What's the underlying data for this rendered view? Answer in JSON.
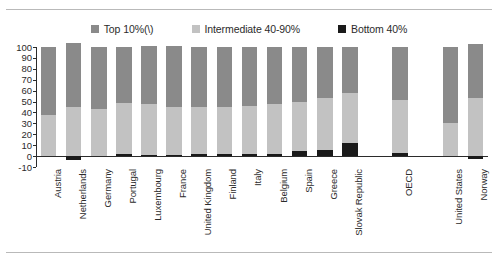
{
  "chart_data": {
    "type": "bar",
    "subtype": "stacked-bar",
    "title": "",
    "xlabel": "",
    "ylabel": "",
    "ylim": [
      -10,
      100
    ],
    "yticks": [
      100,
      90,
      80,
      70,
      60,
      50,
      40,
      30,
      20,
      10,
      0,
      -10
    ],
    "grid": false,
    "legend_position": "top-center",
    "categories": [
      "Austria",
      "Netherlands",
      "Germany",
      "Portugal",
      "Luxembourg",
      "France",
      "United Kingdom",
      "Finland",
      "Italy",
      "Belgium",
      "Spain",
      "Greece",
      "Slovak Republic",
      "OECD",
      "United States",
      "Norway"
    ],
    "series": [
      {
        "name": "Top 10%(\\)",
        "color": "#8a8a8a",
        "values": [
          62,
          59,
          57,
          51,
          53,
          56,
          55,
          55,
          54,
          52,
          50,
          47,
          42,
          49,
          70,
          50
        ]
      },
      {
        "name": "Intermediate 40-90%",
        "color": "#c2c2c2",
        "values": [
          38,
          45,
          43,
          47,
          47,
          44,
          43,
          43,
          44,
          46,
          45,
          47,
          46,
          48,
          30,
          53
        ]
      },
      {
        "name": "Bottom 40%",
        "color": "#1a1a1a",
        "values": [
          0,
          -4,
          0,
          2,
          1,
          1,
          2,
          2,
          2,
          2,
          5,
          6,
          12,
          3,
          0,
          -3
        ]
      }
    ]
  },
  "legend": {
    "items": [
      {
        "label": "Top 10%(\\)",
        "color": "#8a8a8a"
      },
      {
        "label": "Intermediate 40-90%",
        "color": "#c2c2c2"
      },
      {
        "label": "Bottom 40%",
        "color": "#1a1a1a"
      }
    ]
  },
  "axis": {
    "y_ticks": [
      "100",
      "90",
      "80",
      "70",
      "60",
      "50",
      "40",
      "30",
      "20",
      "10",
      "0",
      "-10"
    ]
  }
}
